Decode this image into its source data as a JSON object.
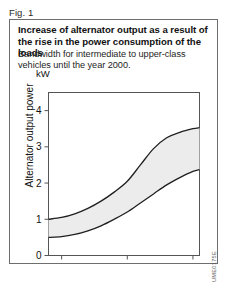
{
  "figure": {
    "label": "Fig. 1",
    "scan_artifact": "",
    "reference_code": "UME0175E"
  },
  "panel": {
    "title": "Increase of alternator output as a result of the rise in the power consumption of the loads",
    "subtitle": "Bandwidth for intermediate to upper-class vehicles until the year 2000."
  },
  "chart_data": {
    "type": "area",
    "title": "Increase of alternator output as a result of the rise in the power consumption of the loads",
    "subtitle": "Bandwidth for intermediate to upper-class vehicles until the year 2000.",
    "xlabel": "Year",
    "ylabel": "Alternator output power",
    "unit": "kW",
    "xlim": [
      1978,
      2001
    ],
    "ylim": [
      0,
      4.5
    ],
    "xticks": [
      1980,
      1990,
      2000
    ],
    "yticks": [
      0,
      1,
      2,
      3,
      4
    ],
    "xtick_labels": [
      "1980",
      "1990",
      "2000"
    ],
    "ytick_labels": [
      "0",
      "1",
      "2",
      "3",
      "4"
    ],
    "grid": false,
    "legend": false,
    "band_fill": "#ececec",
    "line_color": "#1f1f1f",
    "x": [
      1978,
      1980,
      1982,
      1984,
      1986,
      1988,
      1990,
      1992,
      1994,
      1996,
      1998,
      2000,
      2001
    ],
    "series": [
      {
        "name": "Upper bound",
        "values": [
          1.0,
          1.05,
          1.15,
          1.3,
          1.5,
          1.75,
          2.05,
          2.5,
          2.95,
          3.25,
          3.4,
          3.5,
          3.53
        ]
      },
      {
        "name": "Lower bound",
        "values": [
          0.5,
          0.52,
          0.58,
          0.68,
          0.82,
          1.0,
          1.2,
          1.45,
          1.7,
          1.95,
          2.15,
          2.32,
          2.37
        ]
      }
    ]
  }
}
